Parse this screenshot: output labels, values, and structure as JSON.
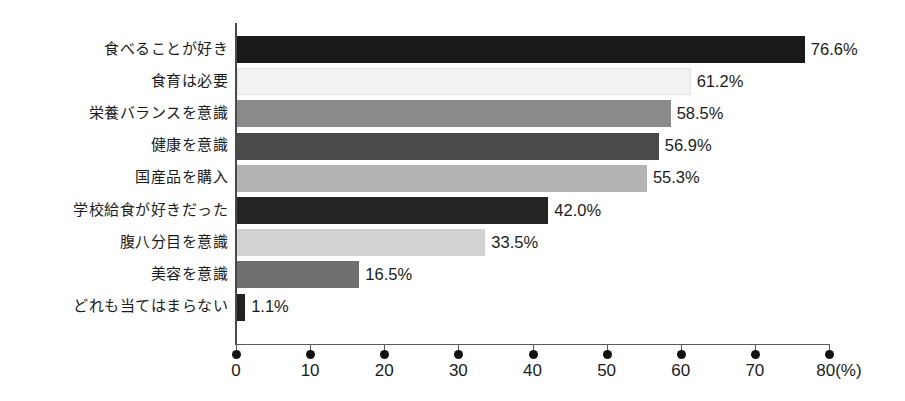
{
  "chart_data": {
    "type": "bar",
    "orientation": "horizontal",
    "title": "",
    "subtitle": "",
    "xlabel": "(%)",
    "ylabel": "",
    "xlim": [
      0,
      80
    ],
    "grid": false,
    "legend": null,
    "axis_unit_label": "80(%)",
    "tick_labels": [
      "0",
      "10",
      "20",
      "30",
      "40",
      "50",
      "60",
      "70",
      "80(%)"
    ],
    "tick_values": [
      0,
      10,
      20,
      30,
      40,
      50,
      60,
      70,
      80
    ],
    "categories": [
      "食べることが好き",
      "食育は必要",
      "栄養バランスを意識",
      "健康を意識",
      "国産品を購入",
      "学校給食が好きだった",
      "腹八分目を意識",
      "美容を意識",
      "どれも当てはまらない"
    ],
    "values": [
      76.6,
      61.2,
      58.5,
      56.9,
      55.3,
      42.0,
      33.5,
      16.5,
      1.1
    ],
    "value_labels": [
      "76.6%",
      "61.2%",
      "58.5%",
      "56.9%",
      "55.3%",
      "42.0%",
      "33.5%",
      "16.5%",
      "1.1%"
    ],
    "bar_colors": [
      "#1a1a1a",
      "#f2f2f2",
      "#8a8a8a",
      "#4a4a4a",
      "#b4b4b4",
      "#242424",
      "#d2d2d2",
      "#707070",
      "#222222"
    ],
    "bars": [
      {
        "category": "食べることが好き",
        "value": 76.6,
        "label": "76.6%",
        "color": "#1a1a1a"
      },
      {
        "category": "食育は必要",
        "value": 61.2,
        "label": "61.2%",
        "color": "#f2f2f2"
      },
      {
        "category": "栄養バランスを意識",
        "value": 58.5,
        "label": "58.5%",
        "color": "#8a8a8a"
      },
      {
        "category": "健康を意識",
        "value": 56.9,
        "label": "56.9%",
        "color": "#4a4a4a"
      },
      {
        "category": "国産品を購入",
        "value": 55.3,
        "label": "55.3%",
        "color": "#b4b4b4"
      },
      {
        "category": "学校給食が好きだった",
        "value": 42.0,
        "label": "42.0%",
        "color": "#242424"
      },
      {
        "category": "腹八分目を意識",
        "value": 33.5,
        "label": "33.5%",
        "color": "#d2d2d2"
      },
      {
        "category": "美容を意識",
        "value": 16.5,
        "label": "16.5%",
        "color": "#707070"
      },
      {
        "category": "どれも当てはまらない",
        "value": 1.1,
        "label": "1.1%",
        "color": "#222222"
      }
    ]
  }
}
